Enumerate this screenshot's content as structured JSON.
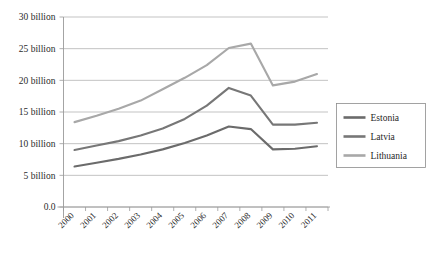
{
  "chart_data": {
    "type": "line",
    "title": "",
    "xlabel": "",
    "ylabel": "",
    "categories": [
      "2000",
      "2001",
      "2002",
      "2003",
      "2004",
      "2005",
      "2006",
      "2007",
      "2008",
      "2009",
      "2010",
      "2011"
    ],
    "ylim": [
      0,
      30
    ],
    "ytick_values": [
      0,
      5,
      10,
      15,
      20,
      25,
      30
    ],
    "ytick_labels": [
      "0.0",
      "5 billion",
      "10 billion",
      "15 billion",
      "20 billion",
      "25 billion",
      "30 billion"
    ],
    "grid": true,
    "legend_position": "right",
    "series": [
      {
        "name": "Estonia",
        "color": "#6b6b6b",
        "values": [
          6.4,
          7.0,
          7.6,
          8.3,
          9.1,
          10.1,
          11.3,
          12.7,
          12.3,
          9.1,
          9.2,
          9.6
        ]
      },
      {
        "name": "Latvia",
        "color": "#777777",
        "values": [
          9.0,
          9.7,
          10.4,
          11.3,
          12.4,
          13.9,
          16.0,
          18.8,
          17.6,
          13.0,
          13.0,
          13.3
        ]
      },
      {
        "name": "Lithuania",
        "color": "#a8a8a8",
        "values": [
          13.4,
          14.4,
          15.5,
          16.8,
          18.6,
          20.4,
          22.4,
          25.1,
          25.8,
          19.2,
          19.8,
          21.0
        ]
      }
    ]
  },
  "legend": {
    "items": [
      {
        "label": "Estonia"
      },
      {
        "label": "Latvia"
      },
      {
        "label": "Lithuania"
      }
    ]
  },
  "colors": {
    "estonia": "#6b6b6b",
    "latvia": "#777777",
    "lithuania": "#a8a8a8",
    "grid": "#a9a9a9",
    "axis": "#9a9a9a",
    "background": "#ffffff"
  }
}
